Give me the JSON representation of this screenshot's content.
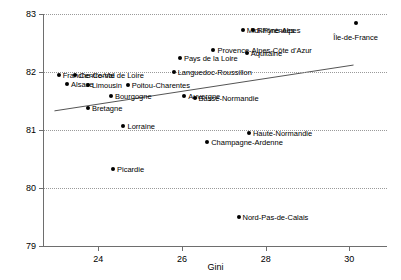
{
  "chart_data": {
    "type": "scatter",
    "title": "",
    "xlabel": "Gini",
    "ylabel": "",
    "xlim": [
      22.7,
      30.9
    ],
    "ylim": [
      79,
      83
    ],
    "xticks": [
      24,
      26,
      28,
      30
    ],
    "yticks": [
      79,
      80,
      81,
      82,
      83
    ],
    "grid": "horizontal-dotted",
    "legend": "none",
    "point_color": "#000000",
    "gridline_color": "#9a9a9a",
    "axis_color": "#6e6e6e",
    "trendline": {
      "visible": true,
      "color": "#555555",
      "x_start": 22.95,
      "y_start": 81.33,
      "x_end": 30.1,
      "y_end": 82.12
    },
    "points": [
      {
        "label": "Franche-Comté",
        "x": 23.05,
        "y": 81.95,
        "label_side": "right"
      },
      {
        "label": "Centre-Val de Loire",
        "x": 23.45,
        "y": 81.95,
        "label_side": "right"
      },
      {
        "label": "Alsace",
        "x": 23.25,
        "y": 81.8,
        "label_side": "right"
      },
      {
        "label": "Limousin",
        "x": 23.75,
        "y": 81.78,
        "label_side": "right"
      },
      {
        "label": "Poitou-Charentes",
        "x": 24.7,
        "y": 81.78,
        "label_side": "right"
      },
      {
        "label": "Bourgogne",
        "x": 24.3,
        "y": 81.58,
        "label_side": "right"
      },
      {
        "label": "Bretagne",
        "x": 23.75,
        "y": 81.38,
        "label_side": "right"
      },
      {
        "label": "Lorraine",
        "x": 24.6,
        "y": 81.07,
        "label_side": "right"
      },
      {
        "label": "Picardie",
        "x": 24.35,
        "y": 80.33,
        "label_side": "right"
      },
      {
        "label": "Pays de la Loire",
        "x": 25.95,
        "y": 82.25,
        "label_side": "right"
      },
      {
        "label": "Languedoc-Roussillon",
        "x": 25.8,
        "y": 82.0,
        "label_side": "right"
      },
      {
        "label": "Auvergne",
        "x": 26.05,
        "y": 81.58,
        "label_side": "right"
      },
      {
        "label": "Basse-Normandie",
        "x": 26.3,
        "y": 81.55,
        "label_side": "right"
      },
      {
        "label": "Champagne-Ardenne",
        "x": 26.6,
        "y": 80.8,
        "label_side": "right"
      },
      {
        "label": "Midi-Pyrénées",
        "x": 27.45,
        "y": 82.72,
        "label_side": "right"
      },
      {
        "label": "Rhône-Alpes",
        "x": 27.7,
        "y": 82.72,
        "label_side": "right"
      },
      {
        "label": "Provence-Alpes-Côte d'Azur",
        "x": 26.75,
        "y": 82.38,
        "label_side": "right"
      },
      {
        "label": "Aquitaine",
        "x": 27.55,
        "y": 82.32,
        "label_side": "right"
      },
      {
        "label": "Haute-Normandie",
        "x": 27.6,
        "y": 80.95,
        "label_side": "right"
      },
      {
        "label": "Nord-Pas-de-Calais",
        "x": 27.35,
        "y": 79.5,
        "label_side": "right"
      },
      {
        "label": "Île-de-France",
        "x": 30.15,
        "y": 82.85,
        "label_side": "center"
      }
    ]
  }
}
